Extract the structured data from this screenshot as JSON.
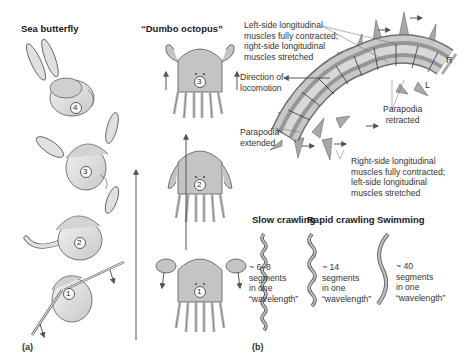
{
  "panel_a": {
    "tag": "(a)",
    "sea_butterfly": {
      "title": "Sea butterfly",
      "stages": [
        "4",
        "3",
        "2",
        "1"
      ]
    },
    "dumbo_octopus": {
      "title": "“Dumbo octopus”",
      "stages": [
        "3",
        "2",
        "1"
      ]
    }
  },
  "panel_b": {
    "tag": "(b)",
    "labels": {
      "left_contracted_l1": "Left-side longitudinal",
      "left_contracted_l2": "muscles fully contracted;",
      "left_contracted_l3": "right-side longitudinal",
      "left_contracted_l4": "muscles stretched",
      "direction_l1": "Direction of",
      "direction_l2": "locomotion",
      "parapodia_extended_l1": "Parapodia",
      "parapodia_extended_l2": "extended",
      "parapodia_retracted_l1": "Parapodia",
      "parapodia_retracted_l2": "retracted",
      "right_contracted_l1": "Right-side longitudinal",
      "right_contracted_l2": "muscles fully contracted;",
      "right_contracted_l3": "left-side longitudinal",
      "right_contracted_l4": "muscles stretched",
      "side_r": "R",
      "side_l": "L"
    },
    "modes": [
      {
        "title": "Slow crawling",
        "l1": "~ 6–8",
        "l2": "segments",
        "l3": "in one",
        "l4": "“wavelength”"
      },
      {
        "title": "Rapid crawling",
        "l1": "~ 14",
        "l2": "segments",
        "l3": "in one",
        "l4": "“wavelength”"
      },
      {
        "title": "Swimming",
        "l1": "~ 40",
        "l2": "segments",
        "l3": "in one",
        "l4": "“wavelength”"
      }
    ]
  },
  "colors": {
    "body_light": "#dcdcdc",
    "body_mid": "#b5b5b5",
    "body_dark": "#8c8c8c",
    "stroke": "#444444"
  }
}
